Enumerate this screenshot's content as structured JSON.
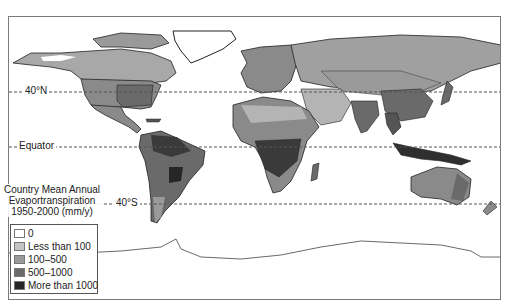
{
  "map": {
    "title_lines": [
      "Country Mean Annual",
      "Evaportranspiration",
      "1950-2000 (mm/y)"
    ],
    "latitude_lines": [
      {
        "label": "40°N",
        "y": 91
      },
      {
        "label": "Equator",
        "y": 146
      },
      {
        "label": "40°S",
        "y": 203
      }
    ],
    "legend": [
      {
        "label": "0",
        "color": "#ffffff"
      },
      {
        "label": "Less than 100",
        "color": "#c4c4c4"
      },
      {
        "label": "100–500",
        "color": "#9a9a9a"
      },
      {
        "label": "500–1000",
        "color": "#6a6a6a"
      },
      {
        "label": "More than 1000",
        "color": "#262626"
      }
    ]
  }
}
